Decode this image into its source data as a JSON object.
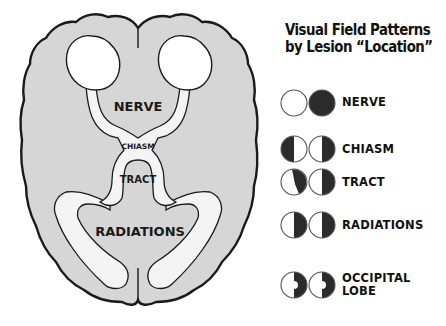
{
  "title": {
    "line1": "Visual Field Patterns",
    "line2": "by Lesion “Location”"
  },
  "brain_labels": {
    "nerve": "NERVE",
    "chiasm": "CHIASM",
    "tract": "TRACT",
    "radiations": "RADIATIONS"
  },
  "legend": [
    {
      "label": "NERVE",
      "left_eye": "normal",
      "right_eye": "complete-loss"
    },
    {
      "label": "CHIASM",
      "left_eye": "temporal-hemianopia (left half dark)",
      "right_eye": "temporal-hemianopia (right half dark)"
    },
    {
      "label": "TRACT",
      "left_eye": "incongruous right hemianopia",
      "right_eye": "right hemianopia"
    },
    {
      "label": "RADIATIONS",
      "left_eye": "right hemianopia",
      "right_eye": "right hemianopia"
    },
    {
      "label_line1": "OCCIPITAL",
      "label_line2": "LOBE",
      "left_eye": "right hemianopia with macular sparing",
      "right_eye": "right hemianopia with macular sparing"
    }
  ],
  "colors": {
    "brain_fill": "#d6d6d6",
    "outline": "#1a1a1a",
    "pathway_fill": "#f4f4f4",
    "defect": "#2b2b2b"
  }
}
